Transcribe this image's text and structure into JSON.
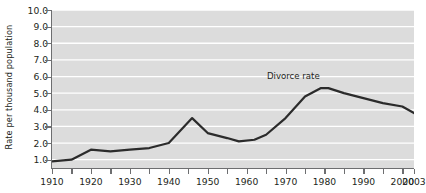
{
  "chart_data": {
    "type": "line",
    "title": "",
    "subtitle": "",
    "xlabel": "",
    "ylabel": "Rate per thousand population",
    "xlim": [
      1910,
      2003
    ],
    "ylim": [
      0.5,
      10.0
    ],
    "grid": true,
    "grid_orientation": "horizontal",
    "grid_color": "#ffffff",
    "plot_background": "#dcdcdc",
    "legend_position": "inline-annotation",
    "x_tick_labels": [
      "1910",
      "1920",
      "1930",
      "1940",
      "1950",
      "1960",
      "1970",
      "1980",
      "1990",
      "2000",
      "2003"
    ],
    "x_tick_values": [
      1910,
      1920,
      1930,
      1940,
      1950,
      1960,
      1970,
      1980,
      1990,
      2000,
      2003
    ],
    "x_minor_tick_values": [
      1915,
      1925,
      1935,
      1945,
      1955,
      1965,
      1975,
      1985,
      1995
    ],
    "y_tick_labels": [
      "1.0",
      "2.0",
      "3.0",
      "4.0",
      "5.0",
      "6.0",
      "7.0",
      "8.0",
      "9.0",
      "10.0"
    ],
    "y_tick_values": [
      1.0,
      2.0,
      3.0,
      4.0,
      5.0,
      6.0,
      7.0,
      8.0,
      9.0,
      10.0
    ],
    "series": [
      {
        "name": "Divorce rate",
        "color": "#2b2b2b",
        "line_width": 2.2,
        "annotation_label": "Divorce rate",
        "annotation_x": 1972,
        "annotation_y": 6.05,
        "x": [
          1910,
          1915,
          1920,
          1925,
          1930,
          1935,
          1940,
          1946,
          1950,
          1955,
          1958,
          1962,
          1965,
          1970,
          1975,
          1979,
          1981,
          1985,
          1990,
          1995,
          2000,
          2003
        ],
        "values": [
          0.9,
          1.0,
          1.6,
          1.5,
          1.6,
          1.7,
          2.0,
          3.5,
          2.6,
          2.3,
          2.1,
          2.2,
          2.5,
          3.5,
          4.8,
          5.3,
          5.3,
          5.0,
          4.7,
          4.4,
          4.2,
          3.8
        ]
      }
    ]
  }
}
